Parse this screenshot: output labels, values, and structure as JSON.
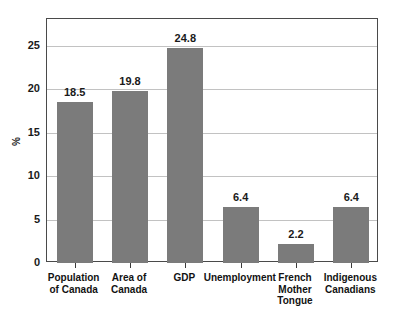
{
  "chart_data": {
    "type": "bar",
    "title": "",
    "xlabel": "",
    "ylabel": "%",
    "ylim": [
      0,
      28.1
    ],
    "yticks": [
      0,
      5,
      10,
      15,
      20,
      25
    ],
    "grid": true,
    "legend": "none",
    "bar_color": "#7b7b7b",
    "categories": [
      "Population\nof Canada",
      "Area of\nCanada",
      "GDP",
      "Unemployment",
      "French\nMother\nTongue",
      "Indigenous\nCanadians"
    ],
    "values": [
      18.5,
      19.8,
      24.8,
      6.4,
      2.2,
      6.4
    ],
    "value_labels": [
      "18.5",
      "19.8",
      "24.8",
      "6.4",
      "2.2",
      "6.4"
    ],
    "ytick_labels": [
      "0",
      "5",
      "10",
      "15",
      "20",
      "25"
    ]
  }
}
